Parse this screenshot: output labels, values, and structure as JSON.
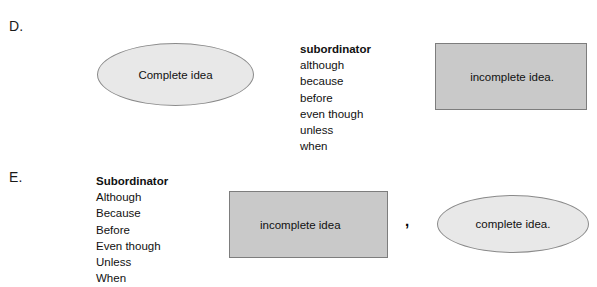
{
  "page": {
    "background_color": "#ffffff",
    "text_color": "#111111"
  },
  "colors": {
    "ellipse_fill": "#e8e8e8",
    "ellipse_border": "#8a8a8a",
    "rect_fill": "#c9c9c9",
    "rect_border": "#7d7d7d"
  },
  "sections": [
    {
      "id": "d",
      "letter": "D.",
      "ellipse_label": "Complete idea",
      "rect_label": "incomplete idea.",
      "word_list": {
        "heading": "subordinator",
        "words": [
          "although",
          "because",
          "before",
          "even though",
          "unless",
          "when"
        ]
      }
    },
    {
      "id": "e",
      "letter": "E.",
      "rect_label": "incomplete idea",
      "separator": ",",
      "ellipse_label": "complete idea.",
      "word_list": {
        "heading": "Subordinator",
        "words": [
          "Although",
          "Because",
          "Before",
          "Even though",
          "Unless",
          "When"
        ]
      }
    }
  ]
}
